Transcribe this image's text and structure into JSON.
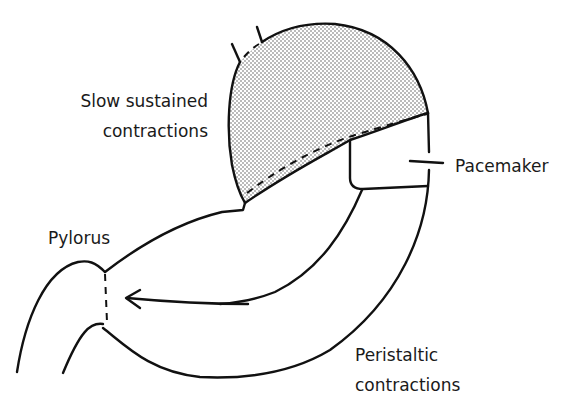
{
  "diagram": {
    "labels": {
      "fundus_line1": "Slow sustained",
      "fundus_line2": "contractions",
      "pacemaker": "Pacemaker",
      "pylorus": "Pylorus",
      "antrum_line1": "Peristaltic",
      "antrum_line2": "contractions"
    },
    "colors": {
      "line": "#111111",
      "stipple": "#555555",
      "background": "#ffffff",
      "text": "#1a1a1a"
    },
    "elements": [
      {
        "name": "fundus",
        "fill": "stippled"
      },
      {
        "name": "pacemaker-marker",
        "type": "tick"
      },
      {
        "name": "pylorus-sphincter",
        "type": "dashed"
      },
      {
        "name": "peristalsis-arrow",
        "direction": "toward pylorus"
      }
    ]
  }
}
